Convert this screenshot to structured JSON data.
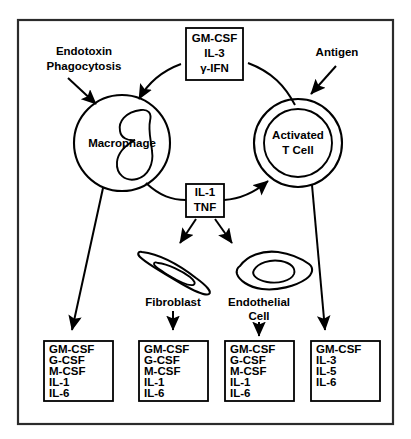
{
  "figure": {
    "frame": {
      "color": "#2b2b2b"
    },
    "colors": {
      "ink": "#000000",
      "background": "#ffffff"
    }
  },
  "stimuli": [
    {
      "id": "endotoxin",
      "lines": [
        "Endotoxin",
        "Phagocytosis"
      ],
      "target": "macrophage"
    },
    {
      "id": "antigen",
      "lines": [
        "Antigen"
      ],
      "target": "activated-t-cell"
    }
  ],
  "cells": [
    {
      "id": "macrophage",
      "label_lines": [
        "Macrophage"
      ]
    },
    {
      "id": "activated-t-cell",
      "label_lines": [
        "Activated",
        "T Cell"
      ]
    },
    {
      "id": "fibroblast",
      "label_lines": [
        "Fibroblast"
      ]
    },
    {
      "id": "endothelial-cell",
      "label_lines": [
        "Endothelial",
        "Cell"
      ]
    }
  ],
  "mediator_boxes": [
    {
      "id": "top-cytokines",
      "items": [
        "GM-CSF",
        "IL-3",
        "γ-IFN"
      ]
    },
    {
      "id": "il1-tnf",
      "items": [
        "IL-1",
        "TNF"
      ]
    }
  ],
  "output_boxes": [
    {
      "id": "macrophage-products",
      "source": "macrophage",
      "items": [
        "GM-CSF",
        "G-CSF",
        "M-CSF",
        "IL-1",
        "IL-6"
      ]
    },
    {
      "id": "fibroblast-products",
      "source": "fibroblast",
      "items": [
        "GM-CSF",
        "G-CSF",
        "M-CSF",
        "IL-1",
        "IL-6"
      ]
    },
    {
      "id": "endothelial-products",
      "source": "endothelial-cell",
      "items": [
        "GM-CSF",
        "G-CSF",
        "M-CSF",
        "IL-1",
        "IL-6"
      ]
    },
    {
      "id": "tcell-products",
      "source": "activated-t-cell",
      "items": [
        "GM-CSF",
        "IL-3",
        "IL-5",
        "IL-6"
      ]
    }
  ]
}
